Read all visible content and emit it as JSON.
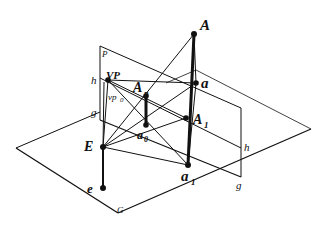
{
  "figure": {
    "type": "perspective projection diagram",
    "labels": {
      "A": "A",
      "a": "a",
      "Ap_main": "A",
      "Ap_sub": "p",
      "A1_main": "A",
      "A1_sub": "1",
      "a0_main": "a",
      "a0_sub": "0",
      "a1_main": "a",
      "a1_sub": "1",
      "VP": "VP",
      "vp0_main": "vp",
      "vp0_sub": "0",
      "E": "E",
      "e": "e",
      "P": "P",
      "h_left": "h",
      "h_right": "h",
      "g_left": "g",
      "g_right": "g",
      "G": "G"
    },
    "colors": {
      "line": "#111111",
      "background": "#ffffff"
    }
  }
}
